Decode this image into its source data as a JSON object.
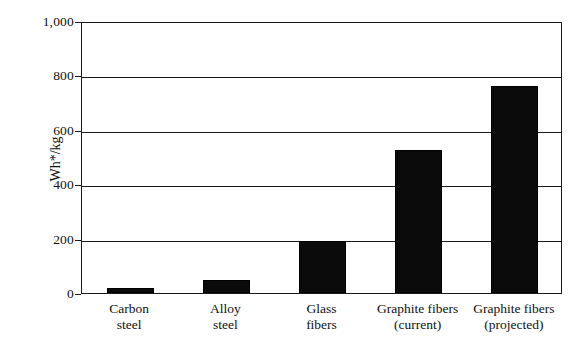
{
  "chart_data": {
    "type": "bar",
    "title": "",
    "xlabel": "",
    "ylabel": "Wh*/kg",
    "categories": [
      "Carbon steel",
      "Alloy steel",
      "Glass fibers",
      "Graphite fibers (current)",
      "Graphite fibers (projected)"
    ],
    "category_lines": [
      [
        "Carbon",
        "steel"
      ],
      [
        "Alloy",
        "steel"
      ],
      [
        "Glass",
        "fibers"
      ],
      [
        "Graphite fibers",
        "(current)"
      ],
      [
        "Graphite fibers",
        "(projected)"
      ]
    ],
    "values": [
      20,
      48,
      190,
      525,
      760
    ],
    "ylim": [
      0,
      1000
    ],
    "yticks": [
      0,
      200,
      400,
      600,
      800,
      1000
    ],
    "ytick_labels": [
      "0",
      "200",
      "400",
      "600",
      "800",
      "1,000"
    ],
    "grid": true,
    "legend": "none",
    "bar_color": "#0b0b0b",
    "axis_color": "#1a1a1a",
    "background": "#ffffff"
  }
}
